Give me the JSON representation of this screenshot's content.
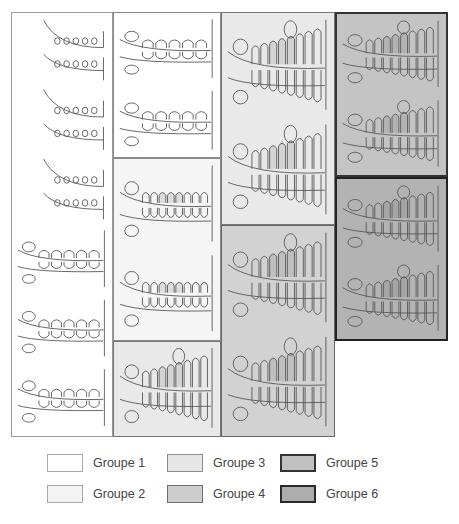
{
  "figure": {
    "panels": [
      {
        "id": "p1",
        "group": 1,
        "x": 11,
        "y": 12,
        "w": 102,
        "h": 425,
        "fill": "#ffffff",
        "border": "#9a9a9a",
        "drawings": 6
      },
      {
        "id": "p2a",
        "group": 1,
        "x": 113,
        "y": 12,
        "w": 108,
        "h": 146,
        "fill": "#ffffff",
        "border": "#8a8a8a",
        "drawings": 2
      },
      {
        "id": "p2b",
        "group": 2,
        "x": 113,
        "y": 158,
        "w": 108,
        "h": 183,
        "fill": "#f5f5f5",
        "border": "#8a8a8a",
        "drawings": 2
      },
      {
        "id": "p2c",
        "group": 3,
        "x": 113,
        "y": 341,
        "w": 108,
        "h": 96,
        "fill": "#e9e9e9",
        "border": "#777777",
        "drawings": 1
      },
      {
        "id": "p3a",
        "group": 3,
        "x": 221,
        "y": 12,
        "w": 114,
        "h": 213,
        "fill": "#e9e9e9",
        "border": "#777777",
        "drawings": 2
      },
      {
        "id": "p3b",
        "group": 4,
        "x": 221,
        "y": 225,
        "w": 114,
        "h": 212,
        "fill": "#d2d2d2",
        "border": "#666666",
        "drawings": 2
      },
      {
        "id": "p4a",
        "group": 5,
        "x": 335,
        "y": 12,
        "w": 113,
        "h": 165,
        "fill": "#c4c4c4",
        "border": "#333333",
        "drawings": 2
      },
      {
        "id": "p4b",
        "group": 6,
        "x": 335,
        "y": 177,
        "w": 113,
        "h": 164,
        "fill": "#b3b3b3",
        "border": "#222222",
        "drawings": 2
      }
    ]
  },
  "legend": {
    "items": [
      {
        "label": "Groupe 1",
        "fill": "#ffffff",
        "border": "#a8a8a8",
        "x": 47,
        "y": 463
      },
      {
        "label": "Groupe 2",
        "fill": "#f3f3f3",
        "border": "#a8a8a8",
        "x": 47,
        "y": 494
      },
      {
        "label": "Groupe 3",
        "fill": "#e6e6e6",
        "border": "#8c8c8c",
        "x": 167,
        "y": 463
      },
      {
        "label": "Groupe 4",
        "fill": "#cdcdcd",
        "border": "#6e6e6e",
        "x": 167,
        "y": 494
      },
      {
        "label": "Groupe 5",
        "fill": "#c0c0c0",
        "border": "#333333",
        "x": 280,
        "y": 463
      },
      {
        "label": "Groupe 6",
        "fill": "#adadad",
        "border": "#2a2a2a",
        "x": 280,
        "y": 494
      }
    ]
  }
}
